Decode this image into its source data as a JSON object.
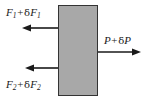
{
  "figure": {
    "name": "force-balance-diagram",
    "width": 154,
    "height": 102,
    "background_color": "#ffffff"
  },
  "block": {
    "name": "shaded-block",
    "fill_color": "#a8a8a8",
    "stroke_color": "#333333",
    "x": 58,
    "y": 5,
    "width": 40,
    "height": 91
  },
  "labels": {
    "top_left": {
      "symbol": "F",
      "subscript": "1",
      "operator": "+",
      "delta": "δ",
      "delta_symbol": "F",
      "delta_subscript": "1",
      "plain_text": "F₁ + δF₁"
    },
    "bottom_left": {
      "symbol": "F",
      "subscript": "2",
      "operator": "+",
      "delta": "δ",
      "delta_symbol": "F",
      "delta_subscript": "2",
      "plain_text": "F₂ + δF₂"
    },
    "right": {
      "symbol": "P",
      "subscript": "",
      "operator": "+",
      "delta": "δ",
      "delta_symbol": "P",
      "delta_subscript": "",
      "plain_text": "P + δP"
    }
  },
  "arrows": {
    "color": "#1a1a1a",
    "top_left": {
      "name": "arrow-force-1",
      "direction": "left",
      "tail_x": 58,
      "tip_x": 22,
      "y": 28
    },
    "bottom_left": {
      "name": "arrow-force-2",
      "direction": "left",
      "tail_x": 58,
      "tip_x": 25,
      "y": 68
    },
    "right": {
      "name": "arrow-pressure",
      "direction": "right",
      "tail_x": 98,
      "tip_x": 141,
      "y": 52
    }
  }
}
